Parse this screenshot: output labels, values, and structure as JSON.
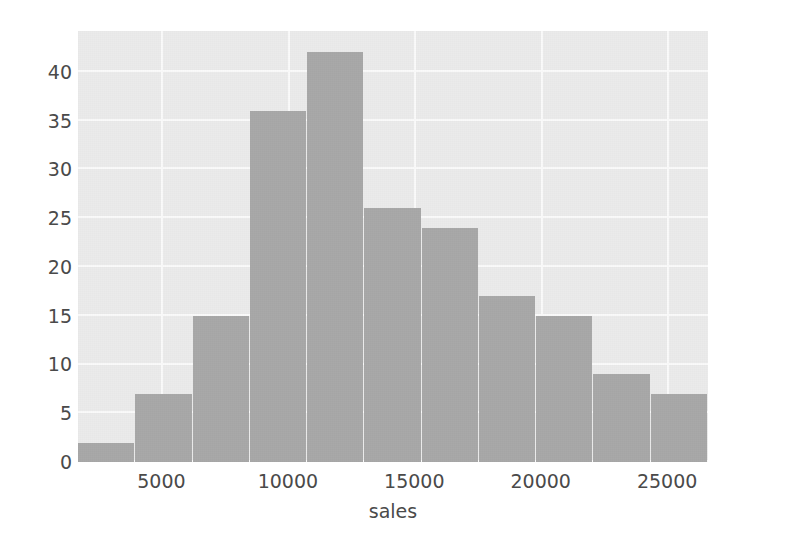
{
  "chart_data": {
    "type": "bar",
    "chart_subtype": "histogram",
    "title": "",
    "xlabel": "sales",
    "ylabel": "",
    "grid": true,
    "legend": null,
    "bar_color": "#a8a8a8",
    "plot_background": "#ebebeb",
    "gridline_color": "#fafafa",
    "tick_label_color": "#4a4a4a",
    "xlim": [
      1700,
      26615
    ],
    "ylim": [
      0,
      44.2
    ],
    "xticks": [
      5000,
      10000,
      15000,
      20000,
      25000
    ],
    "xtick_labels": [
      "5000",
      "10000",
      "15000",
      "20000",
      "25000"
    ],
    "yticks": [
      0,
      5,
      10,
      15,
      20,
      25,
      30,
      35,
      40
    ],
    "ytick_labels": [
      "0",
      "5",
      "10",
      "15",
      "20",
      "25",
      "30",
      "35",
      "40"
    ],
    "n_bins": 11,
    "bin_width": 2265,
    "bin_edges": [
      1700,
      3965,
      6230,
      8495,
      10760,
      13025,
      15290,
      17555,
      19820,
      22085,
      24350,
      26615
    ],
    "bin_centers": [
      2833,
      5098,
      7363,
      9628,
      11893,
      14158,
      16423,
      18688,
      20953,
      23218,
      25483
    ],
    "values": [
      2,
      7,
      15,
      36,
      42,
      26,
      24,
      17,
      15,
      9,
      7
    ],
    "total_count": 200
  }
}
